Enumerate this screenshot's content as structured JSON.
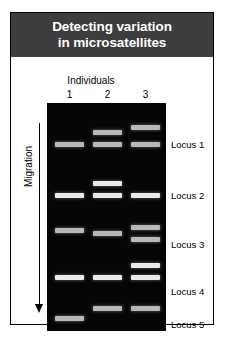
{
  "figure": {
    "title_lines": [
      "Detecting variation",
      "in microsatellites"
    ],
    "title_background": "#3d3d3d",
    "title_color": "#ffffff",
    "gel_background": "#050505",
    "band_color": "#d6d6d6"
  },
  "axes": {
    "columns_label": "Individuals",
    "migration_label": "Migration",
    "lane_numbers": [
      "1",
      "2",
      "3"
    ]
  },
  "loci": [
    {
      "label": "Locus 1",
      "top": 36
    },
    {
      "label": "Locus 2",
      "top": 87
    },
    {
      "label": "Locus 3",
      "top": 136
    },
    {
      "label": "Locus 4",
      "top": 183
    },
    {
      "label": "Locus 5",
      "top": 216
    }
  ],
  "gel_data": {
    "type": "gel-electrophoresis",
    "lanes": [
      {
        "lane": "1",
        "x": 8,
        "width": 29,
        "bands": [
          {
            "locus": "Locus 1",
            "y": 39,
            "intensity": "medium"
          },
          {
            "locus": "Locus 2",
            "y": 90,
            "intensity": "bright"
          },
          {
            "locus": "Locus 3",
            "y": 125,
            "intensity": "medium"
          },
          {
            "locus": "Locus 4",
            "y": 172,
            "intensity": "bright"
          },
          {
            "locus": "Locus 5",
            "y": 213,
            "intensity": "medium"
          }
        ]
      },
      {
        "lane": "2",
        "x": 46,
        "width": 29,
        "bands": [
          {
            "locus": "Locus 1",
            "y": 27,
            "intensity": "medium"
          },
          {
            "locus": "Locus 1",
            "y": 39,
            "intensity": "medium"
          },
          {
            "locus": "Locus 2",
            "y": 78,
            "intensity": "bright"
          },
          {
            "locus": "Locus 2",
            "y": 90,
            "intensity": "bright"
          },
          {
            "locus": "Locus 3",
            "y": 128,
            "intensity": "medium"
          },
          {
            "locus": "Locus 4",
            "y": 172,
            "intensity": "bright"
          },
          {
            "locus": "Locus 5",
            "y": 203,
            "intensity": "medium"
          }
        ]
      },
      {
        "lane": "3",
        "x": 84,
        "width": 29,
        "bands": [
          {
            "locus": "Locus 1",
            "y": 22,
            "intensity": "medium"
          },
          {
            "locus": "Locus 1",
            "y": 39,
            "intensity": "medium"
          },
          {
            "locus": "Locus 2",
            "y": 90,
            "intensity": "bright"
          },
          {
            "locus": "Locus 3",
            "y": 122,
            "intensity": "medium"
          },
          {
            "locus": "Locus 3",
            "y": 134,
            "intensity": "medium"
          },
          {
            "locus": "Locus 4",
            "y": 160,
            "intensity": "bright"
          },
          {
            "locus": "Locus 4",
            "y": 172,
            "intensity": "bright"
          },
          {
            "locus": "Locus 5",
            "y": 203,
            "intensity": "medium"
          }
        ]
      }
    ]
  }
}
